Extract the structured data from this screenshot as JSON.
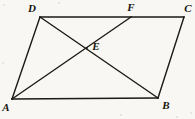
{
  "figure": {
    "background_color": "#f8f7f3",
    "stroke_color": "#1b1a14",
    "label_color": "#16150f",
    "width": 195,
    "height": 119
  },
  "points": [
    {
      "name": "A",
      "label": "A",
      "x": 12,
      "y": 99,
      "label_x": 6,
      "label_y": 107
    },
    {
      "name": "B",
      "label": "B",
      "x": 158,
      "y": 98,
      "label_x": 166,
      "label_y": 105
    },
    {
      "name": "C",
      "label": "C",
      "x": 184,
      "y": 17,
      "label_x": 188,
      "label_y": 8
    },
    {
      "name": "D",
      "label": "D",
      "x": 40,
      "y": 17,
      "label_x": 32,
      "label_y": 8
    },
    {
      "name": "E",
      "label": "E",
      "x": 87,
      "y": 48,
      "label_x": 96,
      "label_y": 46
    },
    {
      "name": "F",
      "label": "F",
      "x": 131,
      "y": 17,
      "label_x": 131,
      "label_y": 7
    }
  ],
  "segments": [
    {
      "name": "side-AB",
      "from": "A",
      "to": "B",
      "x1": 12,
      "y1": 99,
      "x2": 158,
      "y2": 98,
      "width": 1.5
    },
    {
      "name": "side-BC",
      "from": "B",
      "to": "C",
      "x1": 158,
      "y1": 98,
      "x2": 184,
      "y2": 17,
      "width": 1.4
    },
    {
      "name": "side-DC",
      "from": "D",
      "to": "C",
      "x1": 40,
      "y1": 17,
      "x2": 184,
      "y2": 17,
      "width": 1.4
    },
    {
      "name": "side-AD",
      "from": "A",
      "to": "D",
      "x1": 12,
      "y1": 99,
      "x2": 40,
      "y2": 17,
      "width": 1.4
    },
    {
      "name": "diagonal-DB",
      "from": "D",
      "to": "B",
      "x1": 40,
      "y1": 17,
      "x2": 158,
      "y2": 98,
      "width": 1.4
    },
    {
      "name": "segment-AF",
      "from": "A",
      "to": "F",
      "x1": 12,
      "y1": 99,
      "x2": 131,
      "y2": 17,
      "width": 1.4
    }
  ],
  "specks": [
    {
      "x": 3,
      "y": 4,
      "size": 2
    },
    {
      "x": 190,
      "y": 112,
      "size": 2
    },
    {
      "x": 120,
      "y": 114,
      "size": 2
    },
    {
      "x": 176,
      "y": 116,
      "size": 2
    },
    {
      "x": 2,
      "y": 62,
      "size": 2
    },
    {
      "x": 58,
      "y": 2,
      "size": 2
    }
  ]
}
